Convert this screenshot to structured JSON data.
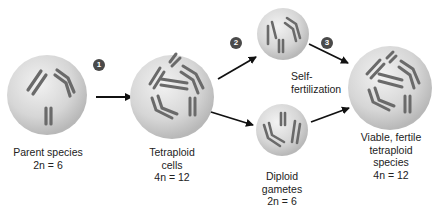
{
  "diagram": {
    "colors": {
      "cell_fill_light": "#ececec",
      "cell_fill_dark": "#bdbdbd",
      "chromosome": "#6e6e6e",
      "arrow": "#111111",
      "badge": "#4a4a4a"
    },
    "steps": [
      {
        "number": "1"
      },
      {
        "number": "2"
      },
      {
        "number": "3"
      }
    ],
    "nodes": {
      "parent": {
        "lines": [
          "Parent species",
          "2n = 6"
        ]
      },
      "tetraploid": {
        "lines": [
          "Tetraploid",
          "cells",
          "4n = 12"
        ]
      },
      "self_fertilization": {
        "lines": [
          "Self-",
          "fertilization"
        ]
      },
      "diploid_gametes": {
        "lines": [
          "Diploid",
          "gametes",
          "2n = 6"
        ]
      },
      "final_species": {
        "lines": [
          "Viable, fertile",
          "tetraploid",
          "species",
          "4n = 12"
        ]
      }
    }
  }
}
